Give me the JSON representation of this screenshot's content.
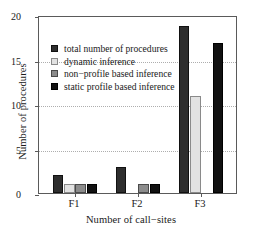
{
  "chart_data": {
    "type": "bar",
    "title": "",
    "xlabel": "Number of call−sites",
    "ylabel": "Number of procedures",
    "categories": [
      "F1",
      "F2",
      "F3"
    ],
    "ylim": [
      0,
      20
    ],
    "yticks": [
      0,
      5,
      10,
      15,
      20
    ],
    "ytick_labels": [
      "0",
      "5",
      "10",
      "15",
      "20"
    ],
    "grid": "horizontal-dotted",
    "legend_position": "upper-left-inside",
    "series": [
      {
        "name": "total number of procedures",
        "color": "#2e2e2e",
        "values": [
          2,
          3,
          19
        ]
      },
      {
        "name": "dynamic inference",
        "color": "#e2e2e2",
        "values": [
          1,
          0,
          11
        ]
      },
      {
        "name": "non−profile based inference",
        "color": "#8c8c8c",
        "values": [
          1,
          1,
          0
        ]
      },
      {
        "name": "static profile based inference",
        "color": "#111111",
        "values": [
          1,
          1,
          17
        ]
      }
    ]
  },
  "axes": {
    "ylabel": "Number of procedures",
    "xlabel": "Number of call−sites",
    "ytick_0": "0",
    "ytick_1": "5",
    "ytick_2": "10",
    "ytick_3": "15",
    "ytick_4": "20",
    "xtick_0": "F1",
    "xtick_1": "F2",
    "xtick_2": "F3"
  },
  "legend": {
    "item_0": "total number of procedures",
    "item_1": "dynamic inference",
    "item_2": "non−profile based inference",
    "item_3": "static profile based inference"
  }
}
